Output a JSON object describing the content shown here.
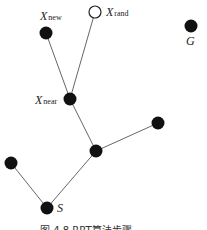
{
  "diagram": {
    "type": "rrt-tree-expansion",
    "nodes": [
      {
        "id": "S",
        "x": 47,
        "y": 208,
        "filled": true,
        "label": "S",
        "sub": ""
      },
      {
        "id": "A",
        "x": 11,
        "y": 163,
        "filled": true,
        "label": "",
        "sub": ""
      },
      {
        "id": "B",
        "x": 96,
        "y": 151,
        "filled": true,
        "label": "",
        "sub": ""
      },
      {
        "id": "C",
        "x": 158,
        "y": 123,
        "filled": true,
        "label": "",
        "sub": ""
      },
      {
        "id": "Xnear",
        "x": 70,
        "y": 99,
        "filled": true,
        "label": "X",
        "sub": "near"
      },
      {
        "id": "Xnew",
        "x": 46,
        "y": 33,
        "filled": true,
        "label": "X",
        "sub": "new"
      },
      {
        "id": "Xrand",
        "x": 95,
        "y": 12,
        "filled": false,
        "label": "X",
        "sub": "rand"
      },
      {
        "id": "G",
        "x": 191,
        "y": 26,
        "filled": true,
        "label": "G",
        "sub": ""
      }
    ],
    "edges": [
      [
        "S",
        "A"
      ],
      [
        "S",
        "B"
      ],
      [
        "B",
        "C"
      ],
      [
        "B",
        "Xnear"
      ],
      [
        "Xnear",
        "Xnew"
      ],
      [
        "Xnear",
        "Xrand"
      ]
    ],
    "caption": "图 4.8  RRT算法步骤"
  }
}
